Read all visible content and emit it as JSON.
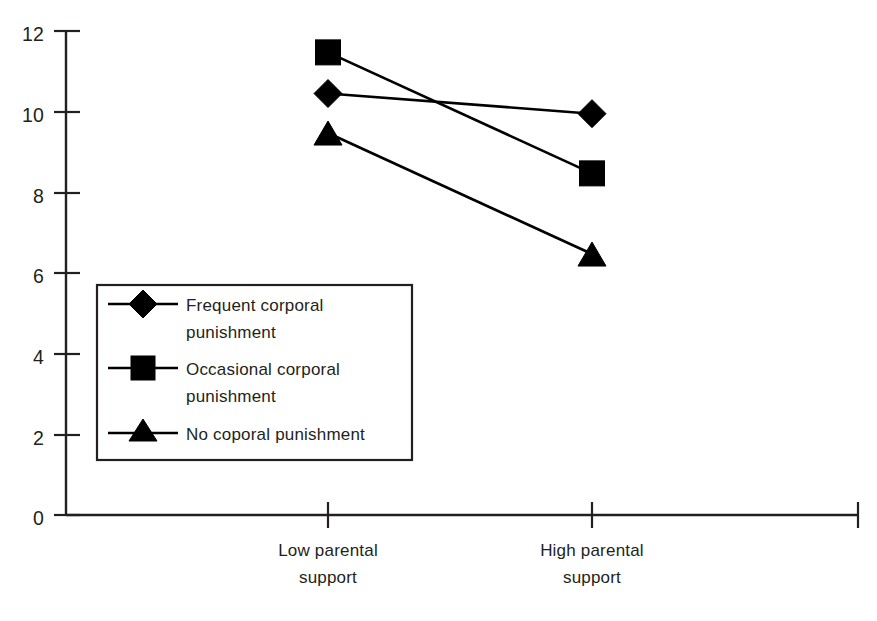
{
  "chart_data": {
    "type": "line",
    "title": "",
    "subtitle": "",
    "xlabel": "",
    "ylabel": "",
    "categories": [
      "Low parental support",
      "High parental support"
    ],
    "category_lines": [
      [
        "Low parental",
        "support"
      ],
      [
        "High parental",
        "support"
      ]
    ],
    "ylim": [
      0,
      12
    ],
    "yticks": [
      0,
      2,
      4,
      6,
      8,
      10,
      12
    ],
    "ytick_labels": [
      "0",
      "2",
      "4",
      "6",
      "8",
      "10",
      "12"
    ],
    "grid": false,
    "legend_position": "inside-lower-left",
    "series": [
      {
        "name": "Frequent corporal punishment",
        "name_lines": [
          "Frequent corporal",
          "punishment"
        ],
        "marker": "diamond",
        "color": "#000000",
        "values": [
          10.45,
          9.95
        ]
      },
      {
        "name": "Occasional corporal punishment",
        "name_lines": [
          "Occasional corporal",
          "punishment"
        ],
        "marker": "square",
        "color": "#000000",
        "values": [
          11.47,
          8.47
        ]
      },
      {
        "name": "No coporal punishment",
        "name_lines": [
          "No coporal punishment"
        ],
        "marker": "triangle",
        "color": "#000000",
        "values": [
          9.47,
          6.47
        ]
      }
    ]
  },
  "axes": {
    "y_tick_0": "0",
    "y_tick_1": "2",
    "y_tick_2": "4",
    "y_tick_3": "6",
    "y_tick_4": "8",
    "y_tick_5": "10",
    "y_tick_6": "12"
  },
  "x_labels": {
    "cat0_line1": "Low parental",
    "cat0_line2": "support",
    "cat1_line1": "High parental",
    "cat1_line2": "support"
  },
  "legend": {
    "item0_line1": "Frequent corporal",
    "item0_line2": "punishment",
    "item1_line1": "Occasional corporal",
    "item1_line2": "punishment",
    "item2_line1": "No coporal punishment"
  },
  "colors": {
    "ink": "#231f20",
    "marker": "#000000",
    "background": "#ffffff"
  }
}
